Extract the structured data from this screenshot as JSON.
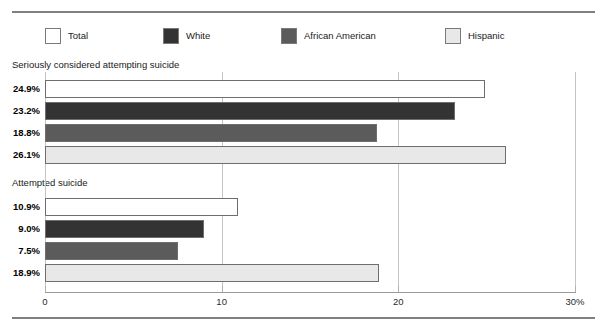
{
  "chart_data": {
    "type": "bar",
    "orientation": "horizontal",
    "title": "",
    "xlabel": "",
    "ylabel": "",
    "xlim": [
      0,
      30
    ],
    "xticks": [
      0,
      10,
      20,
      30
    ],
    "xtick_labels": [
      "0",
      "10",
      "20",
      "30%"
    ],
    "grid": true,
    "legend_position": "top-left",
    "legend": [
      {
        "name": "Total",
        "color": "#ffffff"
      },
      {
        "name": "White",
        "color": "#333333"
      },
      {
        "name": "African American",
        "color": "#5b5b5b"
      },
      {
        "name": "Hispanic",
        "color": "#e8e8e8"
      }
    ],
    "groups": [
      {
        "label": "Seriously considered attempting suicide",
        "categories": [
          "Total",
          "White",
          "African American",
          "Hispanic"
        ],
        "values": [
          24.9,
          23.2,
          18.8,
          26.1
        ],
        "value_labels": [
          "24.9%",
          "23.2%",
          "18.8%",
          "26.1%"
        ]
      },
      {
        "label": "Attempted suicide",
        "categories": [
          "Total",
          "White",
          "African American",
          "Hispanic"
        ],
        "values": [
          10.9,
          9.0,
          7.5,
          18.9
        ],
        "value_labels": [
          "10.9%",
          "9.0%",
          "7.5%",
          "18.9%"
        ]
      }
    ]
  },
  "legend": {
    "items": [
      {
        "label": "Total"
      },
      {
        "label": "White"
      },
      {
        "label": "African American"
      },
      {
        "label": "Hispanic"
      }
    ]
  },
  "groups": [
    {
      "title": "Seriously considered attempting suicide",
      "bars": [
        {
          "series": "Total",
          "value_label": "24.9%"
        },
        {
          "series": "White",
          "value_label": "23.2%"
        },
        {
          "series": "African American",
          "value_label": "18.8%"
        },
        {
          "series": "Hispanic",
          "value_label": "26.1%"
        }
      ]
    },
    {
      "title": "Attempted suicide",
      "bars": [
        {
          "series": "Total",
          "value_label": "10.9%"
        },
        {
          "series": "White",
          "value_label": "9.0%"
        },
        {
          "series": "African American",
          "value_label": "7.5%"
        },
        {
          "series": "Hispanic",
          "value_label": "18.9%"
        }
      ]
    }
  ],
  "axis": {
    "ticks": [
      {
        "label": "0"
      },
      {
        "label": "10"
      },
      {
        "label": "20"
      },
      {
        "label": "30%"
      }
    ]
  },
  "colors": {
    "total": "#ffffff",
    "white": "#333333",
    "african_american": "#5b5b5b",
    "hispanic": "#e8e8e8",
    "bar_border": "#6e6e6e",
    "gridline": "#c4c4c4",
    "rule": "#808080"
  }
}
